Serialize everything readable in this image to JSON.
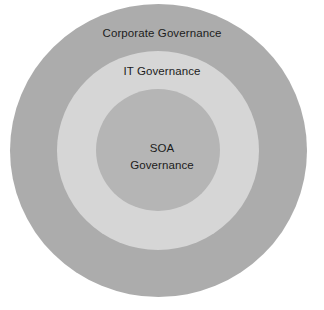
{
  "diagram": {
    "type": "concentric-circles",
    "background_color": "#ffffff",
    "layers": [
      {
        "id": "corporate",
        "label": "Corporate Governance",
        "color": "#acacac",
        "level": 1,
        "position": "outer"
      },
      {
        "id": "it",
        "label": "IT Governance",
        "color": "#d6d6d6",
        "level": 2,
        "position": "middle"
      },
      {
        "id": "soa",
        "label_line_1": "SOA",
        "label_line_2": "Governance",
        "label": "SOA Governance",
        "color": "#b5b5b5",
        "level": 3,
        "position": "inner"
      }
    ],
    "text_color": "#1c1c1c"
  }
}
